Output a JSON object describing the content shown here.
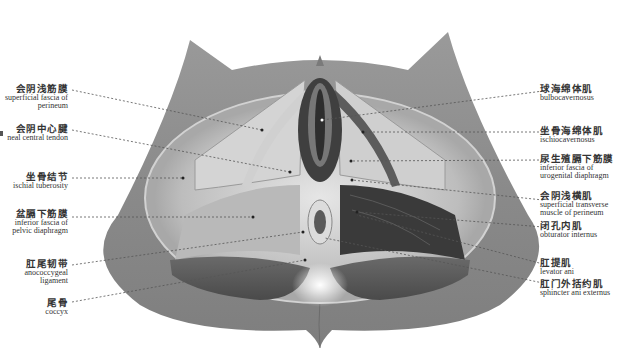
{
  "figure": {
    "colors": {
      "background": "#ffffff",
      "skin": "#8c8c8c",
      "text": "#333333",
      "leader": "#555555"
    }
  },
  "labels_left": [
    {
      "zh": "会阴浅筋膜",
      "en1": "superficial fascia of",
      "en2": "perineum"
    },
    {
      "zh": "会阴中心腱",
      "en1": "neal central tendon",
      "en2": ""
    },
    {
      "zh": "坐骨结节",
      "en1": "ischial tuberosity",
      "en2": ""
    },
    {
      "zh": "盆膈下筋膜",
      "en1": "inferior fascia of",
      "en2": "pelvic diaphragm"
    },
    {
      "zh": "肛尾韧带",
      "en1": "anococcygeal",
      "en2": "ligament"
    },
    {
      "zh": "尾骨",
      "en1": "coccyx",
      "en2": ""
    }
  ],
  "labels_right": [
    {
      "zh": "球海绵体肌",
      "en1": "bulbocavernosus",
      "en2": ""
    },
    {
      "zh": "坐骨海绵体肌",
      "en1": "ischiocavernosus",
      "en2": ""
    },
    {
      "zh": "尿生殖膈下筋膜",
      "en1": "inferior fascia of",
      "en2": "urogenital diaphragm"
    },
    {
      "zh": "会阴浅横肌",
      "en1": "superficial transverse",
      "en2": "muscle of perineum"
    },
    {
      "zh": "闭孔内肌",
      "en1": "obturator internus",
      "en2": ""
    },
    {
      "zh": "肛提肌",
      "en1": "levator ani",
      "en2": ""
    },
    {
      "zh": "肛门外括约肌",
      "en1": "sphincter ani externus",
      "en2": ""
    }
  ]
}
